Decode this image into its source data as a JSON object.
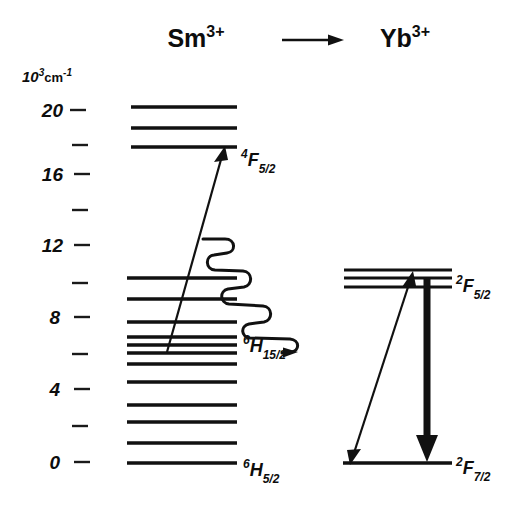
{
  "figure": {
    "type": "energy-level-diagram",
    "title_left": "Sm",
    "title_left_charge": "3+",
    "title_right": "Yb",
    "title_right_charge": "3+",
    "transfer_arrow": "right-arrow-icon",
    "axis": {
      "unit_mantissa": "10",
      "unit_exponent": "3",
      "unit_symbol": "cm",
      "unit_symbol_exponent": "-1",
      "labels": [
        "20",
        "16",
        "12",
        "8",
        "4",
        "0"
      ],
      "label_values": [
        20,
        16,
        12,
        8,
        4,
        0
      ],
      "minor_values": [
        18,
        14,
        10,
        6,
        2
      ],
      "range": [
        0,
        21
      ],
      "tick_spacing_units": 2
    },
    "sm": {
      "label_excited": {
        "pre": "4",
        "letter": "F",
        "sub": "5/2"
      },
      "label_mid": {
        "pre": "6",
        "letter": "H",
        "sub": "15/2"
      },
      "label_ground": {
        "pre": "6",
        "letter": "H",
        "sub": "5/2"
      },
      "levels_cm3": [
        20.1,
        18.9,
        17.9,
        10.5,
        9.4,
        8.1,
        7.2,
        6.8,
        6.3,
        5.7,
        4.8,
        4.6,
        3.3,
        2.4,
        1.2,
        0.0
      ]
    },
    "yb": {
      "label_excited": {
        "pre": "2",
        "letter": "F",
        "sub": "5/2"
      },
      "label_ground": {
        "pre": "2",
        "letter": "F",
        "sub": "7/2"
      },
      "levels_cm3": [
        11.0,
        10.6,
        10.1,
        0.0
      ]
    },
    "processes": [
      {
        "name": "excitation",
        "style": "straight-arrow",
        "from": "Sm 6H15/2",
        "to": "Sm 4F5/2"
      },
      {
        "name": "nonradiative-relaxation-transfer",
        "style": "wavy-arrow",
        "from": "Sm 4F5/2",
        "to": "Yb 2F5/2"
      },
      {
        "name": "yb-absorption-emission",
        "style": "double-head-arrow",
        "from": "Yb 2F7/2",
        "to": "Yb 2F5/2"
      },
      {
        "name": "yb-emission",
        "style": "thick-down-arrow",
        "from": "Yb 2F5/2",
        "to": "Yb 2F7/2"
      }
    ],
    "colors": {
      "ink": "#111111",
      "background": "#ffffff"
    }
  }
}
